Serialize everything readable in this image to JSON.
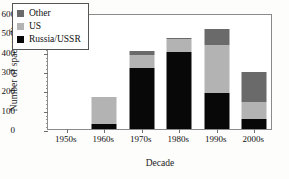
{
  "chart_data": {
    "type": "bar",
    "subtype": "stacked",
    "title": "",
    "xlabel": "Decade",
    "ylabel": "Number of spacecraft",
    "categories": [
      "1950s",
      "1960s",
      "1970s",
      "1980s",
      "1990s",
      "2000s"
    ],
    "series": [
      {
        "name": "Russia/USSR",
        "color": "#080808",
        "values": [
          0,
          25,
          315,
          400,
          185,
          50
        ]
      },
      {
        "name": "US",
        "color": "#b3b3b3",
        "values": [
          0,
          143,
          70,
          65,
          250,
          90
        ]
      },
      {
        "name": "Other",
        "color": "#6a6a6a",
        "values": [
          0,
          0,
          20,
          7,
          83,
          153
        ]
      }
    ],
    "totals": [
      0,
      168,
      405,
      472,
      518,
      293
    ],
    "ylim": [
      0,
      600
    ],
    "yticks": [
      0,
      100,
      200,
      300,
      400,
      500,
      600
    ],
    "ytick_labels": [
      "0",
      "100",
      "200",
      "300",
      "400",
      "500",
      "600"
    ],
    "y_minor_tick_step": 20,
    "grid": false,
    "legend_position": "upper-left",
    "legend_entries": [
      "Other",
      "US",
      "Russia/USSR"
    ]
  },
  "legend": {
    "items": [
      {
        "label": "Other",
        "color": "#6a6a6a"
      },
      {
        "label": "US",
        "color": "#b3b3b3"
      },
      {
        "label": "Russia/USSR",
        "color": "#080808"
      }
    ]
  },
  "axes": {
    "y_title": "Number of spacecraft",
    "x_title": "Decade"
  }
}
